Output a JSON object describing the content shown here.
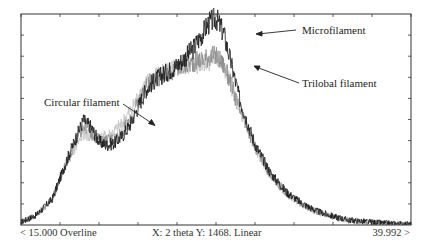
{
  "chart_data": {
    "type": "line",
    "title": "",
    "xlabel": "2 theta",
    "ylabel": "",
    "xlim": [
      15.0,
      39.992
    ],
    "ylim": [
      0,
      1468
    ],
    "y_scale": "Linear",
    "grid": false,
    "legend_position": "annotations",
    "x": [
      15.0,
      16.0,
      17.0,
      18.0,
      19.0,
      19.5,
      20.0,
      20.5,
      21.0,
      21.5,
      22.0,
      22.5,
      23.0,
      23.5,
      24.0,
      25.0,
      26.0,
      27.0,
      27.5,
      28.0,
      28.5,
      29.0,
      30.0,
      31.0,
      32.0,
      33.0,
      34.0,
      35.0,
      36.0,
      37.0,
      38.0,
      39.0,
      39.992
    ],
    "series": [
      {
        "name": "Microfilament",
        "color": "#1a1a1a",
        "values": [
          20,
          70,
          180,
          470,
          730,
          680,
          580,
          555,
          570,
          620,
          700,
          820,
          940,
          1000,
          1040,
          1110,
          1220,
          1400,
          1440,
          1330,
          1110,
          880,
          560,
          360,
          230,
          150,
          95,
          60,
          35,
          25,
          15,
          10,
          5
        ]
      },
      {
        "name": "Trilobal filament",
        "color": "#8a8a8a",
        "values": [
          20,
          70,
          180,
          460,
          700,
          650,
          590,
          585,
          600,
          650,
          720,
          850,
          960,
          1010,
          1040,
          1080,
          1130,
          1170,
          1180,
          1110,
          970,
          800,
          540,
          350,
          220,
          145,
          90,
          55,
          30,
          20,
          12,
          8,
          5
        ]
      },
      {
        "name": "Circular filament",
        "color": "#c2c2c2",
        "values": [
          20,
          70,
          180,
          450,
          640,
          610,
          600,
          615,
          650,
          710,
          790,
          890,
          980,
          1030,
          1060,
          1090,
          1110,
          1140,
          1160,
          1100,
          960,
          790,
          530,
          345,
          220,
          145,
          90,
          55,
          30,
          20,
          12,
          8,
          5
        ]
      }
    ],
    "annotations": [
      {
        "text": "Microfilament",
        "target_series": "Microfilament"
      },
      {
        "text": "Trilobal filament",
        "target_series": "Trilobal filament"
      },
      {
        "text": "Circular filament",
        "target_series": "Circular filament"
      }
    ],
    "footer": {
      "left": "< 15.000 Overline",
      "middle": "X: 2 theta    Y: 1468. Linear",
      "right": "39.992 >"
    }
  },
  "labels": {
    "microfilament": "Microfilament",
    "trilobal": "Trilobal filament",
    "circular": "Circular filament"
  },
  "footer": {
    "left": "< 15.000 Overline",
    "middle": "X: 2 theta    Y: 1468. Linear",
    "right": "39.992 >"
  }
}
